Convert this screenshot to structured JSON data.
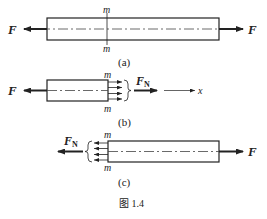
{
  "figure": {
    "caption": "图 1.4",
    "colors": {
      "line": "#222222",
      "background": "#ffffff"
    },
    "panels": [
      {
        "id": "a",
        "label": "(a)",
        "left_force": "F",
        "right_force": "F",
        "section_top": "m",
        "section_bottom": "m"
      },
      {
        "id": "b",
        "label": "(b)",
        "left_force": "F",
        "internal_force": "F",
        "internal_force_sub": "N",
        "axis_label": "x",
        "section_top": "m",
        "section_bottom": "m"
      },
      {
        "id": "c",
        "label": "(c)",
        "right_force": "F",
        "internal_force": "F",
        "internal_force_sub": "N",
        "section_top": "m",
        "section_bottom": "m"
      }
    ]
  }
}
